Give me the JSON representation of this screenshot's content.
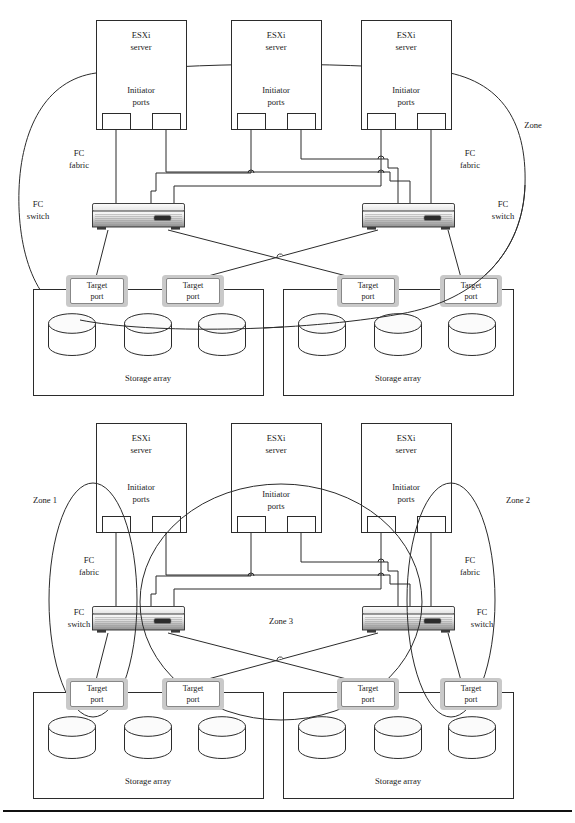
{
  "figure": {
    "diagrams": [
      {
        "id": "single-zone",
        "name": "Single zone configuration",
        "zone_labels": [
          {
            "text": "Zone",
            "x": 533,
            "y": 128
          }
        ],
        "servers": [
          {
            "title": "ESXi",
            "subtitle": "server",
            "ports_title": "Initiator",
            "ports_subtitle": "ports"
          },
          {
            "title": "ESXi",
            "subtitle": "server",
            "ports_title": "Initiator",
            "ports_subtitle": "ports"
          },
          {
            "title": "ESXi",
            "subtitle": "server",
            "ports_title": "Initiator",
            "ports_subtitle": "ports"
          }
        ],
        "fabric_labels": [
          {
            "line1": "FC",
            "line2": "fabric",
            "x": 79,
            "y": 154
          },
          {
            "line1": "FC",
            "line2": "fabric",
            "x": 470,
            "y": 154
          }
        ],
        "switch_labels": [
          {
            "line1": "FC",
            "line2": "switch",
            "x": 33,
            "y": 207
          },
          {
            "line1": "FC",
            "line2": "switch",
            "x": 503,
            "y": 207
          }
        ],
        "target_ports": [
          {
            "line1": "Target",
            "line2": "port"
          },
          {
            "line1": "Target",
            "line2": "port"
          },
          {
            "line1": "Target",
            "line2": "port"
          },
          {
            "line1": "Target",
            "line2": "port"
          }
        ],
        "storage_arrays": [
          {
            "label": "Storage array",
            "disk_count": 3
          },
          {
            "label": "Storage array",
            "disk_count": 3
          }
        ]
      },
      {
        "id": "three-zone",
        "name": "Three zone configuration",
        "zone_labels": [
          {
            "text": "Zone 1",
            "x": 24,
            "y": 500
          },
          {
            "text": "Zone 2",
            "x": 497,
            "y": 500
          },
          {
            "text": "Zone 3",
            "x": 262,
            "y": 624
          }
        ],
        "servers": [
          {
            "title": "ESXi",
            "subtitle": "server",
            "ports_title": "Initiator",
            "ports_subtitle": "ports"
          },
          {
            "title": "ESXi",
            "subtitle": "server",
            "ports_title": "Initiator",
            "ports_subtitle": "ports"
          },
          {
            "title": "ESXi",
            "subtitle": "server",
            "ports_title": "Initiator",
            "ports_subtitle": "ports"
          }
        ],
        "fabric_labels": [
          {
            "line1": "FC",
            "line2": "fabric",
            "x": 79,
            "y": 562
          },
          {
            "line1": "FC",
            "line2": "fabric",
            "x": 470,
            "y": 562
          }
        ],
        "switch_labels": [
          {
            "line1": "FC",
            "line2": "switch",
            "x": 33,
            "y": 615
          },
          {
            "line1": "FC",
            "line2": "switch",
            "x": 503,
            "y": 615
          }
        ],
        "target_ports": [
          {
            "line1": "Target",
            "line2": "port"
          },
          {
            "line1": "Target",
            "line2": "port"
          },
          {
            "line1": "Target",
            "line2": "port"
          },
          {
            "line1": "Target",
            "line2": "port"
          }
        ],
        "storage_arrays": [
          {
            "label": "Storage array",
            "disk_count": 3
          },
          {
            "label": "Storage array",
            "disk_count": 3
          }
        ]
      }
    ],
    "colors": {
      "ink": "#2b2b2b",
      "paper": "#ffffff",
      "target_port_shadow": "#c9c9c9",
      "switch_chassis_light": "#f2f2f2",
      "switch_chassis_dark": "#8d8d8d",
      "switch_led": "#2b2b2b"
    }
  },
  "t": {
    "esxi": "ESXi",
    "server": "server",
    "initiator": "Initiator",
    "ports": "ports",
    "fc": "FC",
    "fabric": "fabric",
    "switch": "switch",
    "target": "Target",
    "port": "port",
    "storage_array": "Storage array",
    "zone": "Zone",
    "zone1": "Zone 1",
    "zone2": "Zone 2",
    "zone3": "Zone 3"
  }
}
